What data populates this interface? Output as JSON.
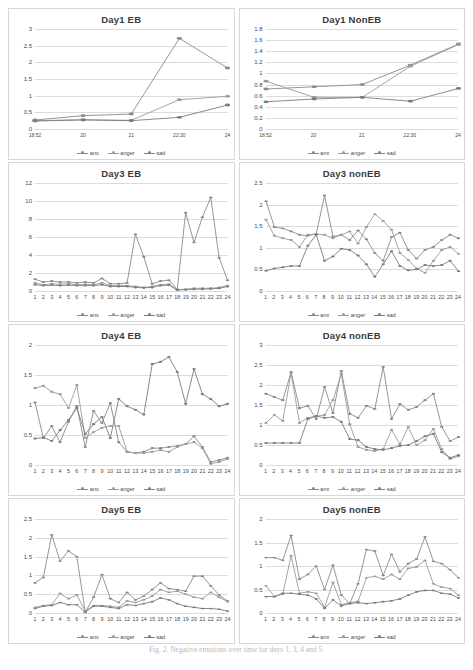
{
  "figure": {
    "caption": "Fig. 2. Negative emotions over time for days 1, 3, 4 and 5."
  },
  "legend": {
    "items": [
      "anx",
      "anger",
      "sad"
    ]
  },
  "colors": {
    "anx": "#8a8a8a",
    "anger": "#9b9b9b",
    "sad": "#7d7d7d",
    "gridline": "#dcdcdc",
    "axis_text": "#4a4a4a",
    "title_text": "#3a3a3a"
  },
  "chart_data": [
    {
      "id": "day1-eb",
      "type": "line",
      "title": "Day1 EB",
      "xlabel": "",
      "ylabel": "",
      "categories": [
        "18:52",
        "20",
        "21",
        "22:30",
        "24"
      ],
      "yticks": [
        0,
        0.5,
        1,
        1.5,
        2,
        2.5,
        3
      ],
      "ylim": [
        0,
        3
      ],
      "grid": true,
      "legend_position": "bottom",
      "series": [
        {
          "name": "anx",
          "values": [
            0.27,
            0.4,
            0.45,
            2.72,
            1.83
          ]
        },
        {
          "name": "anger",
          "values": [
            0.25,
            0.28,
            0.26,
            0.88,
            0.98
          ]
        },
        {
          "name": "sad",
          "values": [
            0.24,
            0.27,
            0.25,
            0.35,
            0.72
          ]
        }
      ]
    },
    {
      "id": "day1-noneb",
      "type": "line",
      "title": "Day1 NonEB",
      "xlabel": "",
      "ylabel": "",
      "categories": [
        "18:52",
        "20",
        "21",
        "22:30",
        "24"
      ],
      "yticks": [
        0,
        0.2,
        0.4,
        0.6,
        0.8,
        1,
        1.2,
        1.4,
        1.6,
        1.8
      ],
      "ylim": [
        0,
        1.8
      ],
      "grid": true,
      "legend_position": "bottom",
      "series": [
        {
          "name": "anx",
          "values": [
            0.72,
            0.76,
            0.8,
            1.15,
            1.53
          ]
        },
        {
          "name": "anger",
          "values": [
            0.86,
            0.57,
            0.57,
            1.13,
            1.52
          ]
        },
        {
          "name": "sad",
          "values": [
            0.49,
            0.54,
            0.57,
            0.5,
            0.73
          ]
        }
      ]
    },
    {
      "id": "day3-eb",
      "type": "line",
      "title": "Day3 EB",
      "xlabel": "",
      "ylabel": "",
      "categories": [
        "1",
        "2",
        "3",
        "4",
        "5",
        "6",
        "7",
        "8",
        "9",
        "10",
        "11",
        "12",
        "13",
        "14",
        "15",
        "16",
        "17",
        "18",
        "19",
        "20",
        "21",
        "22",
        "23",
        "24"
      ],
      "yticks": [
        0,
        2,
        4,
        6,
        8,
        10,
        12
      ],
      "ylim": [
        0,
        12
      ],
      "grid": true,
      "legend_position": "bottom",
      "series": [
        {
          "name": "anx",
          "values": [
            1.3,
            1.0,
            1.1,
            1.0,
            1.0,
            0.9,
            1.0,
            0.9,
            1.4,
            0.8,
            0.8,
            0.9,
            6.3,
            3.8,
            0.8,
            1.1,
            1.2,
            0.2,
            8.7,
            5.4,
            8.2,
            10.4,
            3.7,
            1.2
          ]
        },
        {
          "name": "anger",
          "values": [
            0.9,
            0.7,
            0.8,
            0.75,
            0.8,
            0.7,
            0.75,
            0.7,
            0.9,
            0.6,
            0.6,
            0.6,
            0.5,
            0.4,
            0.5,
            0.7,
            0.75,
            0.15,
            0.2,
            0.3,
            0.3,
            0.3,
            0.4,
            0.6
          ]
        },
        {
          "name": "sad",
          "values": [
            0.7,
            0.6,
            0.65,
            0.6,
            0.65,
            0.6,
            0.6,
            0.6,
            0.7,
            0.5,
            0.5,
            0.5,
            0.4,
            0.35,
            0.4,
            0.6,
            0.65,
            0.1,
            0.15,
            0.2,
            0.2,
            0.25,
            0.3,
            0.5
          ]
        }
      ]
    },
    {
      "id": "day3-noneb",
      "type": "line",
      "title": "Day3 nonEB",
      "xlabel": "",
      "ylabel": "",
      "categories": [
        "1",
        "2",
        "3",
        "4",
        "5",
        "6",
        "7",
        "8",
        "9",
        "10",
        "11",
        "12",
        "13",
        "14",
        "15",
        "16",
        "17",
        "18",
        "19",
        "20",
        "21",
        "22",
        "23",
        "24"
      ],
      "yticks": [
        0,
        0.5,
        1,
        1.5,
        2,
        2.5
      ],
      "ylim": [
        0,
        2.5
      ],
      "grid": true,
      "legend_position": "bottom",
      "series": [
        {
          "name": "anx",
          "values": [
            2.08,
            1.48,
            1.45,
            1.38,
            1.3,
            1.28,
            1.32,
            2.21,
            1.26,
            1.3,
            1.18,
            1.4,
            1.2,
            0.88,
            0.7,
            1.25,
            1.35,
            0.95,
            0.75,
            0.95,
            1.02,
            1.18,
            1.3,
            1.22
          ]
        },
        {
          "name": "anger",
          "values": [
            1.65,
            1.28,
            1.22,
            1.18,
            1.02,
            1.3,
            1.32,
            1.3,
            1.22,
            1.3,
            1.38,
            1.1,
            1.48,
            1.78,
            1.62,
            1.42,
            0.88,
            0.72,
            0.52,
            0.42,
            0.7,
            0.95,
            1.02,
            0.86
          ]
        },
        {
          "name": "sad",
          "values": [
            0.47,
            0.52,
            0.55,
            0.58,
            0.58,
            1.05,
            1.3,
            0.7,
            0.8,
            0.98,
            0.95,
            0.82,
            0.62,
            0.33,
            0.62,
            0.92,
            0.58,
            0.48,
            0.5,
            0.6,
            0.58,
            0.6,
            0.7,
            0.46
          ]
        }
      ]
    },
    {
      "id": "day4-eb",
      "type": "line",
      "title": "Day4 EB",
      "xlabel": "",
      "ylabel": "",
      "categories": [
        "1",
        "2",
        "3",
        "4",
        "5",
        "6",
        "7",
        "8",
        "9",
        "10",
        "11",
        "12",
        "13",
        "14",
        "15",
        "16",
        "17",
        "18",
        "19",
        "20",
        "21",
        "22",
        "23",
        "24"
      ],
      "yticks": [
        0,
        0.5,
        1,
        1.5,
        2
      ],
      "ylim": [
        0,
        2
      ],
      "grid": true,
      "legend_position": "bottom",
      "series": [
        {
          "name": "anx",
          "values": [
            1.04,
            0.45,
            0.65,
            0.38,
            0.72,
            0.98,
            0.3,
            0.9,
            0.7,
            1.03,
            0.38,
            0.22,
            0.2,
            0.22,
            0.28,
            0.28,
            0.3,
            0.32,
            0.35,
            0.48,
            0.3,
            0.05,
            0.08,
            0.12
          ]
        },
        {
          "name": "anger",
          "values": [
            1.28,
            1.32,
            1.22,
            1.18,
            0.95,
            1.33,
            0.45,
            0.55,
            0.62,
            0.65,
            0.65,
            0.22,
            0.2,
            0.2,
            0.22,
            0.25,
            0.22,
            0.3,
            0.35,
            0.38,
            0.28,
            0.02,
            0.05,
            0.1
          ]
        },
        {
          "name": "sad",
          "values": [
            0.44,
            0.46,
            0.4,
            0.58,
            0.75,
            0.95,
            0.52,
            0.68,
            0.8,
            0.45,
            1.1,
            0.98,
            0.92,
            0.84,
            1.68,
            1.72,
            1.8,
            1.55,
            1.02,
            1.6,
            1.18,
            1.1,
            0.98,
            1.02
          ]
        }
      ]
    },
    {
      "id": "day4-noneb",
      "type": "line",
      "title": "Day4 nonEB",
      "xlabel": "",
      "ylabel": "",
      "categories": [
        "1",
        "2",
        "3",
        "4",
        "5",
        "6",
        "7",
        "8",
        "9",
        "10",
        "11",
        "12",
        "13",
        "14",
        "15",
        "16",
        "17",
        "18",
        "19",
        "20",
        "21",
        "22",
        "23",
        "24"
      ],
      "yticks": [
        0,
        0.5,
        1,
        1.5,
        2,
        2.5,
        3
      ],
      "ylim": [
        0,
        3
      ],
      "grid": true,
      "legend_position": "bottom",
      "series": [
        {
          "name": "anx",
          "values": [
            1.78,
            1.7,
            1.62,
            2.32,
            1.42,
            1.48,
            1.15,
            1.95,
            1.3,
            2.35,
            1.28,
            1.18,
            1.48,
            1.4,
            2.45,
            1.15,
            1.52,
            1.38,
            1.45,
            1.62,
            1.78,
            0.95,
            0.6,
            0.7
          ]
        },
        {
          "name": "anger",
          "values": [
            1.05,
            1.25,
            1.1,
            2.3,
            1.05,
            1.18,
            1.22,
            1.25,
            1.62,
            2.28,
            1.02,
            0.45,
            0.38,
            0.35,
            0.4,
            0.88,
            0.52,
            0.95,
            0.5,
            0.62,
            0.9,
            0.4,
            0.15,
            0.22
          ]
        },
        {
          "name": "sad",
          "values": [
            0.55,
            0.55,
            0.55,
            0.55,
            0.55,
            1.15,
            1.22,
            1.18,
            1.2,
            1.08,
            0.65,
            0.62,
            0.45,
            0.4,
            0.38,
            0.42,
            0.48,
            0.5,
            0.6,
            0.72,
            0.78,
            0.32,
            0.18,
            0.25
          ]
        }
      ]
    },
    {
      "id": "day5-eb",
      "type": "line",
      "title": "Day5 EB",
      "xlabel": "",
      "ylabel": "",
      "categories": [
        "1",
        "2",
        "3",
        "4",
        "5",
        "6",
        "7",
        "8",
        "9",
        "10",
        "11",
        "12",
        "13",
        "14",
        "15",
        "16",
        "17",
        "18",
        "19",
        "20",
        "21",
        "22",
        "23",
        "24"
      ],
      "yticks": [
        0,
        0.5,
        1,
        1.5,
        2,
        2.5
      ],
      "ylim": [
        0,
        2.5
      ],
      "grid": true,
      "legend_position": "bottom",
      "series": [
        {
          "name": "anx",
          "values": [
            0.8,
            0.95,
            2.08,
            1.38,
            1.65,
            1.5,
            0.02,
            0.42,
            1.02,
            0.38,
            0.28,
            0.55,
            0.35,
            0.45,
            0.62,
            0.8,
            0.65,
            0.62,
            0.58,
            0.98,
            0.98,
            0.72,
            0.48,
            0.32
          ]
        },
        {
          "name": "anger",
          "values": [
            0.15,
            0.2,
            0.22,
            0.52,
            0.38,
            0.48,
            0.05,
            0.2,
            0.2,
            0.18,
            0.15,
            0.32,
            0.28,
            0.35,
            0.45,
            0.62,
            0.55,
            0.58,
            0.5,
            0.42,
            0.38,
            0.55,
            0.42,
            0.3
          ]
        },
        {
          "name": "sad",
          "values": [
            0.12,
            0.18,
            0.2,
            0.28,
            0.22,
            0.22,
            0.02,
            0.18,
            0.18,
            0.15,
            0.12,
            0.22,
            0.2,
            0.25,
            0.3,
            0.4,
            0.35,
            0.25,
            0.18,
            0.15,
            0.12,
            0.12,
            0.1,
            0.05
          ]
        }
      ]
    },
    {
      "id": "day5-noneb",
      "type": "line",
      "title": "Day5 nonEB",
      "xlabel": "",
      "ylabel": "",
      "categories": [
        "1",
        "2",
        "3",
        "4",
        "5",
        "6",
        "7",
        "8",
        "9",
        "10",
        "11",
        "12",
        "13",
        "14",
        "15",
        "16",
        "17",
        "18",
        "19",
        "20",
        "21",
        "22",
        "23",
        "24"
      ],
      "yticks": [
        0,
        0.5,
        1,
        1.5,
        2
      ],
      "ylim": [
        0,
        2
      ],
      "grid": true,
      "legend_position": "bottom",
      "series": [
        {
          "name": "anx",
          "values": [
            1.18,
            1.18,
            1.12,
            1.65,
            0.72,
            0.82,
            1.0,
            0.5,
            1.02,
            0.38,
            0.2,
            0.62,
            1.35,
            1.32,
            0.8,
            1.25,
            0.88,
            1.05,
            1.15,
            1.62,
            1.1,
            1.05,
            0.92,
            0.75
          ]
        },
        {
          "name": "anger",
          "values": [
            0.58,
            0.35,
            0.4,
            1.22,
            0.42,
            0.45,
            0.42,
            0.12,
            0.65,
            0.18,
            0.22,
            0.25,
            0.75,
            0.78,
            0.72,
            0.82,
            0.72,
            0.95,
            0.98,
            1.12,
            0.62,
            0.55,
            0.52,
            0.38
          ]
        },
        {
          "name": "sad",
          "values": [
            0.35,
            0.35,
            0.42,
            0.42,
            0.4,
            0.38,
            0.3,
            0.1,
            0.28,
            0.15,
            0.2,
            0.22,
            0.2,
            0.22,
            0.24,
            0.26,
            0.3,
            0.38,
            0.45,
            0.48,
            0.48,
            0.42,
            0.4,
            0.32
          ]
        }
      ]
    }
  ]
}
